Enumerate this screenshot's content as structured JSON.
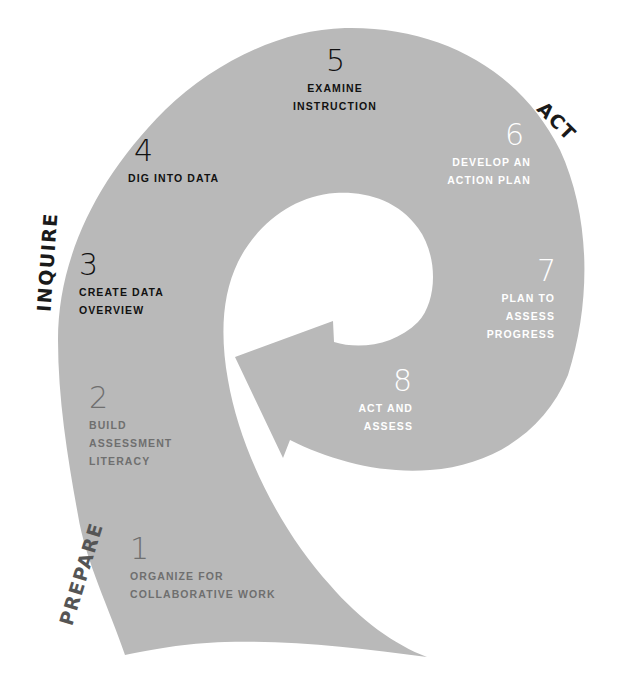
{
  "colors": {
    "shape_fill": "#b9b9b9",
    "background": "#ffffff",
    "text_dark": "#111111",
    "text_grey": "#6f6f6f",
    "text_light": "#ffffff",
    "phase_label": "#1a1a1a",
    "phase_prepare": "#555555"
  },
  "phases": {
    "prepare": "PREPARE",
    "inquire": "INQUIRE",
    "act": "ACT"
  },
  "steps": [
    {
      "number": "1",
      "label_lines": [
        "ORGANIZE FOR",
        "COLLABORATIVE WORK"
      ],
      "phase": "PREPARE"
    },
    {
      "number": "2",
      "label_lines": [
        "BUILD",
        "ASSESSMENT",
        "LITERACY"
      ],
      "phase": "PREPARE"
    },
    {
      "number": "3",
      "label_lines": [
        "CREATE DATA",
        "OVERVIEW"
      ],
      "phase": "INQUIRE"
    },
    {
      "number": "4",
      "label_lines": [
        "DIG INTO DATA"
      ],
      "phase": "INQUIRE"
    },
    {
      "number": "5",
      "label_lines": [
        "EXAMINE",
        "INSTRUCTION"
      ],
      "phase": "INQUIRE"
    },
    {
      "number": "6",
      "label_lines": [
        "DEVELOP AN",
        "ACTION PLAN"
      ],
      "phase": "ACT"
    },
    {
      "number": "7",
      "label_lines": [
        "PLAN TO",
        "ASSESS",
        "PROGRESS"
      ],
      "phase": "ACT"
    },
    {
      "number": "8",
      "label_lines": [
        "ACT AND",
        "ASSESS"
      ],
      "phase": "ACT"
    }
  ]
}
